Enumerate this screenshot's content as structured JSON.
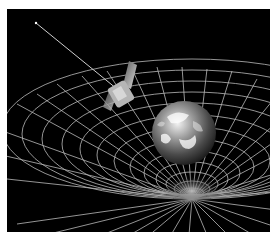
{
  "image": {
    "description": "Illustration of Earth warping a spacetime grid with an orbiting satellite",
    "background_color": "#000000",
    "grid_color": "#d8d8d8",
    "elements": [
      "earth",
      "satellite",
      "spacetime-grid",
      "orbit-trail"
    ]
  }
}
